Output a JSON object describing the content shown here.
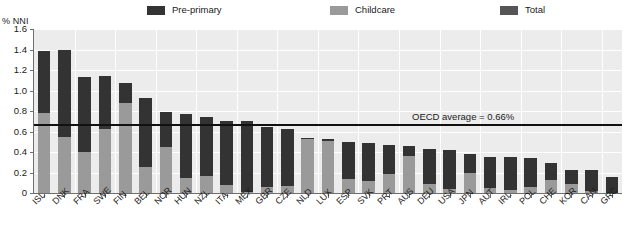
{
  "axis_title": "% NNI",
  "legend": [
    {
      "label": "Pre-primary",
      "color": "#333333",
      "x": 147
    },
    {
      "label": "Childcare",
      "color": "#9a9a9a",
      "x": 330
    },
    {
      "label": "Total",
      "color": "#555555",
      "x": 500
    }
  ],
  "annotation": {
    "text": "OECD average = 0.66%",
    "value": 0.66
  },
  "chart_data": {
    "type": "bar",
    "stacked": true,
    "title": "",
    "xlabel": "",
    "ylabel": "% NNI",
    "ylim": [
      0,
      1.6
    ],
    "yticks": [
      0,
      0.2,
      0.4,
      0.6,
      0.8,
      1.0,
      1.2,
      1.4,
      1.6
    ],
    "ytick_labels": [
      "0",
      "0.2",
      "0.4",
      "0.6",
      "0.8",
      "1.0",
      "1.2",
      "1.4",
      "1.6"
    ],
    "grid": true,
    "legend_position": "top",
    "categories": [
      "ISL",
      "DNK",
      "FRA",
      "SWE",
      "FIN",
      "BEL",
      "NOR",
      "HUN",
      "NZL",
      "ITA",
      "MEX",
      "GBR",
      "CZE",
      "NLD",
      "LUX",
      "ESP",
      "SVK",
      "PRT",
      "AUS",
      "DEU",
      "USA",
      "JPN",
      "AUT",
      "IRL",
      "POL",
      "CHE",
      "KOR",
      "CAN",
      "GRC"
    ],
    "series": [
      {
        "name": "Childcare",
        "color": "#9a9a9a",
        "values": [
          0.78,
          0.55,
          0.4,
          0.62,
          0.88,
          0.25,
          0.45,
          0.15,
          0.17,
          0.08,
          0.01,
          0.06,
          0.07,
          0.53,
          0.51,
          0.14,
          0.12,
          0.19,
          0.36,
          0.09,
          0.04,
          0.2,
          0.05,
          0.03,
          0.06,
          0.13,
          0.09,
          0.02,
          0.0
        ]
      },
      {
        "name": "Pre-primary",
        "color": "#333333",
        "values": [
          0.61,
          0.85,
          0.73,
          0.52,
          0.19,
          0.68,
          0.34,
          0.62,
          0.57,
          0.62,
          0.69,
          0.58,
          0.55,
          0.01,
          0.02,
          0.36,
          0.37,
          0.28,
          0.1,
          0.34,
          0.38,
          0.18,
          0.3,
          0.32,
          0.28,
          0.16,
          0.13,
          0.2,
          0.16
        ]
      }
    ],
    "totals": [
      1.39,
      1.4,
      1.13,
      1.14,
      1.07,
      0.93,
      0.79,
      0.77,
      0.74,
      0.7,
      0.7,
      0.64,
      0.62,
      0.54,
      0.53,
      0.5,
      0.49,
      0.47,
      0.46,
      0.43,
      0.42,
      0.38,
      0.35,
      0.35,
      0.34,
      0.29,
      0.22,
      0.22,
      0.16
    ],
    "oecd_average": 0.66
  }
}
